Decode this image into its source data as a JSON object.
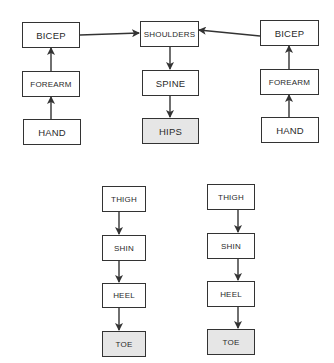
{
  "diagram": {
    "type": "skeleton-hierarchy",
    "colors": {
      "border": "#333333",
      "fill": "#ffffff",
      "shaded_fill": "#e6e6e6",
      "arrow": "#333333"
    },
    "nodes": {
      "left_bicep": "BICEP",
      "left_forearm": "FOREARM",
      "left_hand": "HAND",
      "shoulders": "SHOULDERS",
      "spine": "SPINE",
      "hips": "HIPS",
      "right_bicep": "BICEP",
      "right_forearm": "FOREARM",
      "right_hand": "HAND",
      "left_thigh": "THIGH",
      "left_shin": "SHIN",
      "left_heel": "HEEL",
      "left_toe": "TOE",
      "right_thigh": "THIGH",
      "right_shin": "SHIN",
      "right_heel": "HEEL",
      "right_toe": "TOE"
    },
    "edges": [
      {
        "from": "left_hand",
        "to": "left_forearm"
      },
      {
        "from": "left_forearm",
        "to": "left_bicep"
      },
      {
        "from": "left_bicep",
        "to": "shoulders"
      },
      {
        "from": "right_hand",
        "to": "right_forearm"
      },
      {
        "from": "right_forearm",
        "to": "right_bicep"
      },
      {
        "from": "right_bicep",
        "to": "shoulders"
      },
      {
        "from": "shoulders",
        "to": "spine"
      },
      {
        "from": "spine",
        "to": "hips"
      },
      {
        "from": "left_thigh",
        "to": "left_shin"
      },
      {
        "from": "left_shin",
        "to": "left_heel"
      },
      {
        "from": "left_heel",
        "to": "left_toe"
      },
      {
        "from": "right_thigh",
        "to": "right_shin"
      },
      {
        "from": "right_shin",
        "to": "right_heel"
      },
      {
        "from": "right_heel",
        "to": "right_toe"
      }
    ],
    "shaded_nodes": [
      "hips",
      "left_toe",
      "right_toe"
    ]
  }
}
